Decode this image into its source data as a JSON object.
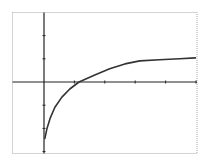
{
  "colors": {
    "background": "#ffffff",
    "frame": "#a8a8a8",
    "axis": "#222222",
    "curve": "#333333"
  },
  "chart_data": {
    "type": "line",
    "title": "",
    "xlabel": "",
    "ylabel": "",
    "grid": false,
    "legend": null,
    "xlim": [
      -1,
      5
    ],
    "ylim": [
      -3,
      2.9
    ],
    "x_tick_step": 1,
    "y_tick_step": 1,
    "x_ticks": [
      1,
      2,
      3,
      4,
      5
    ],
    "y_ticks": [
      -3,
      -2,
      -1,
      1,
      2
    ],
    "series": [
      {
        "name": "f(x)",
        "x": [
          0.03,
          0.1,
          0.2,
          0.36,
          0.59,
          0.85,
          1.15,
          1.67,
          2.16,
          2.66,
          3.15,
          3.8,
          4.46,
          4.98
        ],
        "y": [
          -2.43,
          -2.0,
          -1.57,
          -1.09,
          -0.65,
          -0.3,
          0.0,
          0.3,
          0.57,
          0.78,
          0.91,
          0.96,
          1.0,
          1.04
        ]
      }
    ]
  }
}
